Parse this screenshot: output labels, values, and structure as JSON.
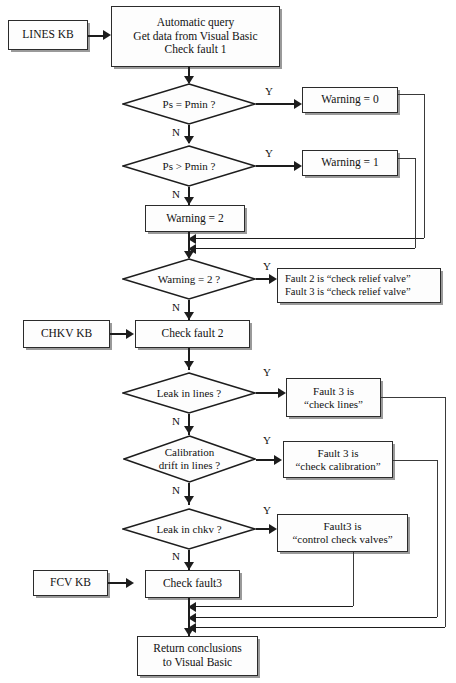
{
  "diagram": {
    "type": "flowchart",
    "colors": {
      "stroke": "#1d1d1d",
      "fill": "#fdfdfd",
      "shadow": "#9a9a9a",
      "text": "#111111"
    }
  },
  "nodes": {
    "lines_kb": {
      "label": "LINES  KB",
      "shape": "process"
    },
    "start": {
      "line1": "Automatic query",
      "line2": "Get data from Visual Basic",
      "line3": "Check fault 1",
      "shape": "process"
    },
    "d_ps_eq": {
      "label": "Ps = Pmin ?",
      "shape": "decision"
    },
    "warning0": {
      "label": "Warning = 0",
      "shape": "process"
    },
    "d_ps_gt": {
      "label": "Ps > Pmin ?",
      "shape": "decision"
    },
    "warning1": {
      "label": "Warning = 1",
      "shape": "process"
    },
    "warning2": {
      "label": "Warning = 2",
      "shape": "process"
    },
    "d_warn2": {
      "label": "Warning = 2 ?",
      "shape": "decision"
    },
    "fault_relief": {
      "line1": "Fault 2 is “check relief valve”",
      "line2": "Fault 3 is “check relief valve”",
      "shape": "process"
    },
    "chkv_kb": {
      "label": "CHKV  KB",
      "shape": "process"
    },
    "check_fault2": {
      "label": "Check fault 2",
      "shape": "process"
    },
    "d_leak_lines": {
      "label": "Leak in lines ?",
      "shape": "decision"
    },
    "fault_lines": {
      "line1": "Fault 3 is",
      "line2": "“check lines”",
      "shape": "process"
    },
    "d_calib": {
      "line1": "Calibration",
      "line2": "drift in lines ?",
      "shape": "decision"
    },
    "fault_calib": {
      "line1": "Fault 3 is",
      "line2": "“check calibration”",
      "shape": "process"
    },
    "d_leak_chkv": {
      "label": "Leak in chkv ?",
      "shape": "decision"
    },
    "fault_chkv": {
      "line1": "Fault3 is",
      "line2": "“control check valves”",
      "shape": "process"
    },
    "fcv_kb": {
      "label": "FCV  KB",
      "shape": "process"
    },
    "check_fault3": {
      "label": "Check fault3",
      "shape": "process"
    },
    "return": {
      "line1": "Return conclusions",
      "line2": "to Visual Basic",
      "shape": "process"
    }
  },
  "edge_labels": {
    "y1": "Y",
    "n1": "N",
    "y2": "Y",
    "n2": "N",
    "y3": "Y",
    "n3": "N",
    "y4": "Y",
    "n4": "N",
    "y5": "Y",
    "n5": "N",
    "y6": "Y",
    "n6": "N"
  }
}
